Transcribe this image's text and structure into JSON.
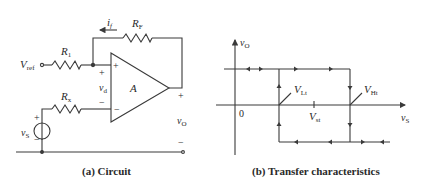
{
  "circuit": {
    "caption": "(a)  Circuit",
    "labels": {
      "i_f": "i",
      "i_f_sub": "f",
      "R_F": "R",
      "R_F_sub": "F",
      "R_1": "R",
      "R_1_sub": "1",
      "V_ref": "V",
      "V_ref_sub": "ref",
      "R_x": "R",
      "R_x_sub": "x",
      "v_S": "v",
      "v_S_sub": "S",
      "v_d": "v",
      "v_d_sub": "d",
      "A": "A",
      "v_O": "v",
      "v_O_sub": "O",
      "plus": "+",
      "minus": "−"
    }
  },
  "transfer": {
    "caption": "(b)  Transfer characteristics",
    "y_axis": "v",
    "y_axis_sub": "O",
    "x_axis": "v",
    "x_axis_sub": "S",
    "origin": "0",
    "V_Lt": "V",
    "V_Lt_sub": "Lt",
    "V_Ht": "V",
    "V_Ht_sub": "Ht",
    "V_st": "V",
    "V_st_sub": "st"
  },
  "colors": {
    "line": "#3a3a3a",
    "text": "#2a2a2a",
    "background": "#ffffff"
  }
}
